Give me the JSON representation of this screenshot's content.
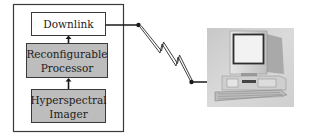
{
  "diagram": {
    "type": "system-block-diagram",
    "blocks": [
      {
        "id": "downlink",
        "lines": [
          "Downlink"
        ],
        "style": "light"
      },
      {
        "id": "processor",
        "lines": [
          "Reconfigurable",
          "Processor"
        ],
        "style": "shaded"
      },
      {
        "id": "imager",
        "lines": [
          "Hyperspectral",
          "Imager"
        ],
        "style": "shaded"
      }
    ],
    "flow": [
      {
        "from": "imager",
        "to": "processor",
        "kind": "arrow"
      },
      {
        "from": "processor",
        "to": "downlink",
        "kind": "arrow"
      },
      {
        "from": "downlink",
        "to": "ground-computer",
        "kind": "wireless-link"
      }
    ],
    "ground_station": {
      "id": "ground-computer",
      "icon": "desktop-computer-icon"
    },
    "colors": {
      "box_border": "#3a3a3a",
      "shaded_fill": "#bdbdbd",
      "light_fill": "#ffffff",
      "line": "#1a1a1a",
      "computer_bg": "#d6d6d6"
    }
  }
}
